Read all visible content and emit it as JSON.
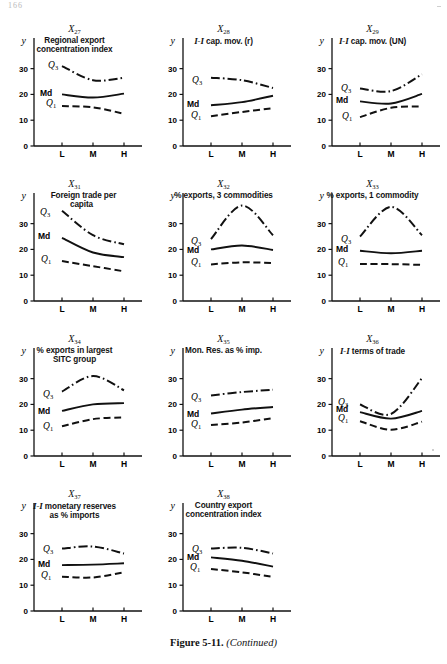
{
  "page_header": "166",
  "caption": {
    "figure": "Figure 5-11.",
    "note": "(Continued)"
  },
  "axis": {
    "ylabel": "y",
    "yticks": [
      "0",
      "10",
      "20",
      "30"
    ],
    "xticks": [
      "L",
      "M",
      "H"
    ],
    "ylim": [
      0,
      38
    ],
    "series_labels": {
      "q3": "Q",
      "q3_sub": "3",
      "md": "Md",
      "q1": "Q",
      "q1_sub": "1"
    }
  },
  "chart_data": [
    {
      "type": "line",
      "panel": "X",
      "panel_sub": "27",
      "title": "Regional export concentration index",
      "title_lines": [
        "Regional export",
        "concentration index"
      ],
      "xlabel": "",
      "ylabel": "y",
      "categories": [
        "L",
        "M",
        "H"
      ],
      "ylim": [
        0,
        38
      ],
      "grid": false,
      "series": [
        {
          "name": "Q3",
          "style": "dash-dot",
          "values": [
            31.0,
            25.5,
            26.5
          ],
          "label_x": 0.1,
          "label_y": 31.5
        },
        {
          "name": "Md",
          "style": "solid",
          "values": [
            20.0,
            18.8,
            20.3
          ],
          "label_x": 0.02,
          "label_y": 20.6
        },
        {
          "name": "Q1",
          "style": "dashed",
          "values": [
            15.5,
            15.0,
            12.5
          ],
          "label_x": 0.08,
          "label_y": 16.6
        }
      ]
    },
    {
      "type": "line",
      "panel": "X",
      "panel_sub": "28",
      "title": "I-I cap. mov. (r)",
      "title_lines": [
        "I-I cap. mov. (r)"
      ],
      "title_italic": true,
      "xlabel": "",
      "ylabel": "y",
      "categories": [
        "L",
        "M",
        "H"
      ],
      "ylim": [
        0,
        38
      ],
      "grid": false,
      "series": [
        {
          "name": "Q3",
          "style": "dash-dot",
          "values": [
            26.5,
            25.5,
            22.5
          ],
          "label_x": 0.05,
          "label_y": 25.6
        },
        {
          "name": "Md",
          "style": "solid",
          "values": [
            15.8,
            17.0,
            19.5
          ],
          "label_x": 0.0,
          "label_y": 16.4
        },
        {
          "name": "Q1",
          "style": "dashed",
          "values": [
            11.5,
            13.2,
            14.7
          ],
          "label_x": 0.04,
          "label_y": 11.9
        }
      ]
    },
    {
      "type": "line",
      "panel": "X",
      "panel_sub": "29",
      "title": "I-I cap. mov. (UN)",
      "title_lines": [
        "I-I cap. mov. (UN)"
      ],
      "title_italic": true,
      "xlabel": "",
      "ylabel": "y",
      "categories": [
        "L",
        "M",
        "H"
      ],
      "ylim": [
        0,
        38
      ],
      "grid": false,
      "series": [
        {
          "name": "Q3",
          "style": "dash-dot",
          "values": [
            22.3,
            21.3,
            27.8
          ],
          "label_x": 0.05,
          "label_y": 22.6
        },
        {
          "name": "Md",
          "style": "solid",
          "values": [
            17.3,
            16.5,
            20.2
          ],
          "label_x": 0.0,
          "label_y": 17.9
        },
        {
          "name": "Q1",
          "style": "dashed",
          "values": [
            11.2,
            14.8,
            15.3
          ],
          "label_x": 0.06,
          "label_y": 11.6
        }
      ]
    },
    {
      "type": "line",
      "panel": "X",
      "panel_sub": "31",
      "title": "Foreign trade per capita",
      "title_lines": [
        "Foreign trade per",
        "capita"
      ],
      "title_indent": true,
      "xlabel": "",
      "ylabel": "y",
      "categories": [
        "L",
        "M",
        "H"
      ],
      "ylim": [
        0,
        38
      ],
      "grid": false,
      "series": [
        {
          "name": "Q3",
          "style": "dash-dot",
          "values": [
            35.0,
            25.5,
            22.0
          ],
          "label_x": 0.02,
          "label_y": 34.4
        },
        {
          "name": "Md",
          "style": "solid",
          "values": [
            24.5,
            18.8,
            17.0
          ],
          "label_x": 0.0,
          "label_y": 25.1
        },
        {
          "name": "Q1",
          "style": "dashed",
          "values": [
            15.5,
            13.5,
            11.5
          ],
          "label_x": 0.03,
          "label_y": 16.3
        }
      ]
    },
    {
      "type": "line",
      "panel": "X",
      "panel_sub": "32",
      "title": "% exports, 3 commodities",
      "title_lines": [
        "% exports, 3 commodities"
      ],
      "xlabel": "",
      "ylabel": "y",
      "categories": [
        "L",
        "M",
        "H"
      ],
      "ylim": [
        0,
        38
      ],
      "grid": false,
      "series": [
        {
          "name": "Q3",
          "style": "dash-dot",
          "values": [
            24.0,
            37.0,
            25.5
          ],
          "label_x": 0.04,
          "label_y": 23.2
        },
        {
          "name": "Md",
          "style": "solid",
          "values": [
            20.0,
            21.5,
            19.8
          ],
          "label_x": 0.0,
          "label_y": 19.8
        },
        {
          "name": "Q1",
          "style": "dashed",
          "values": [
            14.2,
            15.0,
            14.7
          ],
          "label_x": 0.04,
          "label_y": 15.2
        }
      ]
    },
    {
      "type": "line",
      "panel": "X",
      "panel_sub": "33",
      "title": "% exports, 1 commodity",
      "title_lines": [
        "% exports, 1 commodity"
      ],
      "xlabel": "",
      "ylabel": "y",
      "categories": [
        "L",
        "M",
        "H"
      ],
      "ylim": [
        0,
        38
      ],
      "grid": false,
      "series": [
        {
          "name": "Q3",
          "style": "dash-dot",
          "values": [
            25.0,
            36.5,
            25.5
          ],
          "label_x": 0.05,
          "label_y": 24.0
        },
        {
          "name": "Md",
          "style": "solid",
          "values": [
            19.5,
            18.5,
            19.5
          ],
          "label_x": 0.0,
          "label_y": 20.0
        },
        {
          "name": "Q1",
          "style": "dashed",
          "values": [
            14.3,
            14.3,
            14.0
          ],
          "label_x": 0.02,
          "label_y": 15.3
        }
      ]
    },
    {
      "type": "line",
      "panel": "X",
      "panel_sub": "34",
      "title": "% exports in largest SITC group",
      "title_lines": [
        "% exports in largest",
        "SITC group"
      ],
      "xlabel": "",
      "ylabel": "y",
      "categories": [
        "L",
        "M",
        "H"
      ],
      "ylim": [
        0,
        38
      ],
      "grid": false,
      "series": [
        {
          "name": "Q3",
          "style": "dash-dot",
          "values": [
            25.0,
            31.0,
            25.5
          ],
          "label_x": 0.05,
          "label_y": 24.2
        },
        {
          "name": "Md",
          "style": "solid",
          "values": [
            17.5,
            20.0,
            20.5
          ],
          "label_x": 0.0,
          "label_y": 17.4
        },
        {
          "name": "Q1",
          "style": "dashed",
          "values": [
            11.5,
            14.3,
            15.0
          ],
          "label_x": 0.05,
          "label_y": 11.8
        }
      ]
    },
    {
      "type": "line",
      "panel": "X",
      "panel_sub": "35",
      "title": "Mon. Res. as % imp.",
      "title_lines": [
        "Mon. Res. as % imp."
      ],
      "xlabel": "",
      "ylabel": "y",
      "categories": [
        "L",
        "M",
        "H"
      ],
      "ylim": [
        0,
        38
      ],
      "grid": false,
      "series": [
        {
          "name": "Q3",
          "style": "dash-dot",
          "values": [
            23.5,
            24.8,
            25.7
          ],
          "label_x": 0.04,
          "label_y": 23.0
        },
        {
          "name": "Md",
          "style": "solid",
          "values": [
            16.5,
            18.0,
            19.0
          ],
          "label_x": 0.0,
          "label_y": 16.3
        },
        {
          "name": "Q1",
          "style": "dashed",
          "values": [
            12.0,
            13.0,
            14.7
          ],
          "label_x": 0.04,
          "label_y": 12.4
        }
      ]
    },
    {
      "type": "line",
      "panel": "X",
      "panel_sub": "36",
      "title": "I-I terms of trade",
      "title_lines": [
        "I-I terms of trade"
      ],
      "title_italic": true,
      "xlabel": "",
      "ylabel": "y",
      "categories": [
        "L",
        "M",
        "H"
      ],
      "ylim": [
        0,
        38
      ],
      "grid": false,
      "series": [
        {
          "name": "Q3",
          "style": "dash-dot",
          "values": [
            20.0,
            16.3,
            30.2
          ],
          "label_x": 0.02,
          "label_y": 20.8
        },
        {
          "name": "Md",
          "style": "solid",
          "values": [
            17.0,
            14.5,
            17.5
          ],
          "label_x": 0.0,
          "label_y": 18.2
        },
        {
          "name": "Q1",
          "style": "dashed",
          "values": [
            13.5,
            10.2,
            13.3
          ],
          "label_x": 0.02,
          "label_y": 14.6
        }
      ]
    },
    {
      "type": "line",
      "panel": "X",
      "panel_sub": "37",
      "title": "I-I monetary reserves as % imports",
      "title_lines": [
        "I-I monetary reserves",
        "as % imports"
      ],
      "title_italic_first": true,
      "xlabel": "",
      "ylabel": "y",
      "categories": [
        "L",
        "M",
        "H"
      ],
      "ylim": [
        0,
        38
      ],
      "grid": false,
      "series": [
        {
          "name": "Q3",
          "style": "dash-dot",
          "values": [
            24.2,
            25.0,
            22.3
          ],
          "label_x": 0.05,
          "label_y": 24.0
        },
        {
          "name": "Md",
          "style": "solid",
          "values": [
            17.8,
            18.0,
            18.5
          ],
          "label_x": 0.0,
          "label_y": 18.4
        },
        {
          "name": "Q1",
          "style": "dashed",
          "values": [
            13.3,
            13.0,
            15.0
          ],
          "label_x": 0.03,
          "label_y": 14.0
        }
      ]
    },
    {
      "type": "line",
      "panel": "X",
      "panel_sub": "38",
      "title": "Country export concentration index",
      "title_lines": [
        "Country export",
        "concentration index"
      ],
      "xlabel": "",
      "ylabel": "y",
      "categories": [
        "L",
        "M",
        "H"
      ],
      "ylim": [
        0,
        38
      ],
      "grid": false,
      "series": [
        {
          "name": "Q3",
          "style": "dash-dot",
          "values": [
            24.2,
            24.5,
            22.3
          ],
          "label_x": 0.05,
          "label_y": 24.2
        },
        {
          "name": "Md",
          "style": "solid",
          "values": [
            20.8,
            19.5,
            17.2
          ],
          "label_x": 0.0,
          "label_y": 21.0
        },
        {
          "name": "Q1",
          "style": "dashed",
          "values": [
            16.3,
            15.0,
            13.2
          ],
          "label_x": 0.03,
          "label_y": 17.0
        }
      ]
    }
  ]
}
